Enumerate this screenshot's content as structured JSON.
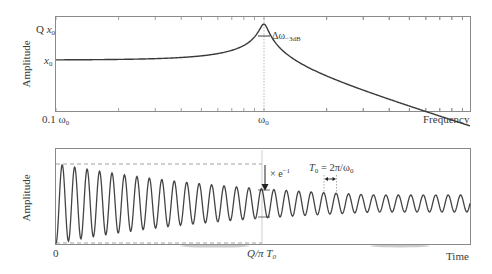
{
  "top_panel": {
    "ylabel": "Amplitude",
    "y_ticks": {
      "q_x0": {
        "prefix": "Q ",
        "var": "x",
        "sub": "0"
      },
      "x0": {
        "var": "x",
        "sub": "0"
      }
    },
    "x_ticks": {
      "left": {
        "text": "0.1 ω",
        "sub": "0"
      },
      "center": {
        "text": "ω",
        "sub": "0"
      }
    },
    "xlabel": "Frequency",
    "annotation": {
      "text": "Δω",
      "sub": "−3dB"
    }
  },
  "bottom_panel": {
    "ylabel": "Amplitude",
    "x_ticks": {
      "origin": "0",
      "decay": {
        "text": "Q/π T",
        "sub": "0"
      }
    },
    "xlabel": "Time",
    "decay_annotation": {
      "text": "× e",
      "sup": "−1"
    },
    "period_annotation": {
      "t": "T",
      "t_sub": "0",
      "eq": " = 2π/ω",
      "eq_sub": "0"
    }
  },
  "chart_data": [
    {
      "type": "line",
      "title": "Frequency response of resonator",
      "xlabel": "Frequency",
      "ylabel": "Amplitude",
      "x_scale": "log",
      "x_range": [
        "0.1 ω0",
        "~10 ω0"
      ],
      "y_ticks": [
        "x0",
        "Q x0"
      ],
      "series": [
        {
          "name": "amplitude",
          "shape": "resonance peak at ω0 reaching ~Q·x0, flat at x0 for low frequency, decaying above ω0"
        }
      ],
      "annotations": [
        "Δω_-3dB (peak width)",
        "dotted vertical line at ω0"
      ]
    },
    {
      "type": "line",
      "title": "Ring-down in time domain",
      "xlabel": "Time",
      "ylabel": "Amplitude",
      "x_ticks": [
        "0",
        "Q/π T0"
      ],
      "series": [
        {
          "name": "decaying oscillation",
          "envelope": "exponential decay, amplitude falls by e^-1 at Q/π T0",
          "period": "T0 = 2π/ω0",
          "cycles_shown": 33
        }
      ],
      "annotations": [
        "× e^-1",
        "T0 = 2π/ω0",
        "dashed envelope lines at initial amplitude"
      ]
    }
  ]
}
